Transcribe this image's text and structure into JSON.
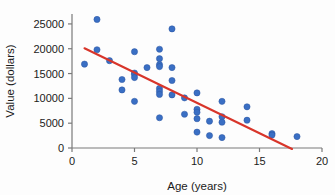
{
  "chart_data": {
    "type": "scatter",
    "title": "",
    "xlabel": "Age (years)",
    "ylabel": "Value (dollars)",
    "xlim": [
      0,
      20
    ],
    "ylim": [
      0,
      27000
    ],
    "xticks": [
      0,
      5,
      10,
      15,
      20
    ],
    "xtick_labels": [
      "0",
      "5",
      "10",
      "15",
      "20"
    ],
    "yticks": [
      0,
      5000,
      10000,
      15000,
      20000,
      25000
    ],
    "ytick_labels": [
      "0",
      "5000",
      "10000",
      "15000",
      "20000",
      "25000"
    ],
    "grid": false,
    "legend": "none",
    "point_color": "#3a6fc4",
    "point_edge_color": "#2a55a0",
    "point_size": 3.1,
    "axis_color": "#7a7a7a",
    "points": [
      {
        "x": 1.0,
        "y": 16900
      },
      {
        "x": 2.0,
        "y": 25900
      },
      {
        "x": 2.0,
        "y": 19800
      },
      {
        "x": 3.0,
        "y": 17600
      },
      {
        "x": 4.0,
        "y": 13800
      },
      {
        "x": 4.0,
        "y": 11700
      },
      {
        "x": 5.0,
        "y": 19400
      },
      {
        "x": 5.0,
        "y": 15100
      },
      {
        "x": 5.0,
        "y": 14800
      },
      {
        "x": 5.0,
        "y": 14200
      },
      {
        "x": 5.0,
        "y": 9400
      },
      {
        "x": 6.0,
        "y": 16200
      },
      {
        "x": 7.0,
        "y": 19900
      },
      {
        "x": 7.0,
        "y": 18000
      },
      {
        "x": 7.0,
        "y": 16800
      },
      {
        "x": 7.0,
        "y": 16400
      },
      {
        "x": 7.0,
        "y": 12000
      },
      {
        "x": 7.0,
        "y": 11400
      },
      {
        "x": 7.0,
        "y": 10800
      },
      {
        "x": 7.0,
        "y": 6100
      },
      {
        "x": 8.0,
        "y": 24000
      },
      {
        "x": 8.0,
        "y": 16200
      },
      {
        "x": 8.0,
        "y": 13600
      },
      {
        "x": 8.0,
        "y": 10700
      },
      {
        "x": 9.0,
        "y": 10100
      },
      {
        "x": 9.0,
        "y": 6800
      },
      {
        "x": 10.0,
        "y": 11100
      },
      {
        "x": 10.0,
        "y": 7800
      },
      {
        "x": 10.0,
        "y": 7200
      },
      {
        "x": 10.0,
        "y": 5900
      },
      {
        "x": 10.0,
        "y": 3200
      },
      {
        "x": 11.0,
        "y": 5400
      },
      {
        "x": 11.0,
        "y": 2500
      },
      {
        "x": 12.0,
        "y": 9400
      },
      {
        "x": 12.0,
        "y": 6300
      },
      {
        "x": 12.0,
        "y": 5200
      },
      {
        "x": 12.0,
        "y": 2100
      },
      {
        "x": 14.0,
        "y": 8300
      },
      {
        "x": 14.0,
        "y": 5600
      },
      {
        "x": 16.0,
        "y": 2900
      },
      {
        "x": 16.0,
        "y": 2600
      },
      {
        "x": 18.0,
        "y": 2300
      }
    ],
    "trendline": {
      "color": "#d8352a",
      "x0": 1.0,
      "y0": 20100,
      "x1": 17.6,
      "y1": -200
    }
  }
}
